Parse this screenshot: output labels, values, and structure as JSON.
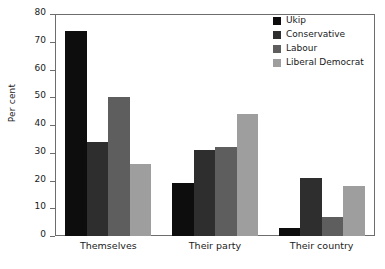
{
  "chart_data": {
    "type": "bar",
    "title": "",
    "xlabel": "",
    "ylabel": "Per cent",
    "ylim": [
      0,
      80
    ],
    "yticks": [
      0,
      10,
      20,
      30,
      40,
      50,
      60,
      70,
      80
    ],
    "grid": false,
    "legend_position": "top-right",
    "categories": [
      "Themselves",
      "Their party",
      "Their country"
    ],
    "series": [
      {
        "name": "Ukip",
        "color": "#0d0d0d",
        "values": [
          74,
          19,
          3
        ]
      },
      {
        "name": "Conservative",
        "color": "#2e2e2e",
        "values": [
          34,
          31,
          21
        ]
      },
      {
        "name": "Labour",
        "color": "#5e5e5e",
        "values": [
          50,
          32,
          7
        ]
      },
      {
        "name": "Liberal Democrat",
        "color": "#9e9e9e",
        "values": [
          26,
          44,
          18
        ]
      }
    ]
  }
}
